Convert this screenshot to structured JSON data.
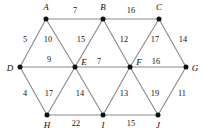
{
  "figure": {
    "type": "weighted-undirected-graph",
    "width": 202,
    "height": 133,
    "background_color": "#ffffff",
    "edge_color": "#8c8c8c",
    "node_color": "#111111",
    "text_color": "#111111"
  },
  "nodes": [
    {
      "id": "A",
      "label": "A",
      "x": 46,
      "y": 19,
      "label_x": 46,
      "label_y": 8,
      "row": "top"
    },
    {
      "id": "B",
      "label": "B",
      "x": 103,
      "y": 19,
      "label_x": 103,
      "label_y": 8,
      "row": "top"
    },
    {
      "id": "C",
      "label": "C",
      "x": 159,
      "y": 19,
      "label_x": 159,
      "label_y": 8,
      "row": "top"
    },
    {
      "id": "D",
      "label": "D",
      "x": 20,
      "y": 67,
      "label_x": 10,
      "label_y": 69,
      "row": "middle"
    },
    {
      "id": "E",
      "label": "E",
      "x": 75,
      "y": 67,
      "label_x": 84,
      "label_y": 63,
      "row": "middle"
    },
    {
      "id": "F",
      "label": "F",
      "x": 130,
      "y": 67,
      "label_x": 139,
      "label_y": 63,
      "row": "middle"
    },
    {
      "id": "G",
      "label": "G",
      "x": 186,
      "y": 67,
      "label_x": 195,
      "label_y": 69,
      "row": "middle"
    },
    {
      "id": "H",
      "label": "H",
      "x": 47,
      "y": 115,
      "label_x": 47,
      "label_y": 126,
      "row": "bottom"
    },
    {
      "id": "I",
      "label": "I",
      "x": 103,
      "y": 115,
      "label_x": 103,
      "label_y": 126,
      "row": "bottom"
    },
    {
      "id": "J",
      "label": "J",
      "x": 158,
      "y": 115,
      "label_x": 158,
      "label_y": 126,
      "row": "bottom"
    }
  ],
  "edges": [
    {
      "from": "A",
      "to": "B",
      "weight": 7,
      "label_x": 75,
      "label_y": 11
    },
    {
      "from": "B",
      "to": "C",
      "weight": 16,
      "label_x": 131,
      "label_y": 11
    },
    {
      "from": "D",
      "to": "A",
      "weight": 5,
      "label_x": 25,
      "label_y": 40
    },
    {
      "from": "A",
      "to": "E",
      "weight": 10,
      "label_x": 48,
      "label_y": 40
    },
    {
      "from": "E",
      "to": "B",
      "weight": 15,
      "label_x": 81,
      "label_y": 40
    },
    {
      "from": "B",
      "to": "F",
      "weight": 12,
      "label_x": 124,
      "label_y": 40
    },
    {
      "from": "F",
      "to": "C",
      "weight": 17,
      "label_x": 155,
      "label_y": 40
    },
    {
      "from": "C",
      "to": "G",
      "weight": 14,
      "label_x": 183,
      "label_y": 40
    },
    {
      "from": "D",
      "to": "E",
      "weight": 9,
      "label_x": 49,
      "label_y": 60
    },
    {
      "from": "E",
      "to": "F",
      "weight": 7,
      "label_x": 99,
      "label_y": 62
    },
    {
      "from": "F",
      "to": "G",
      "weight": 16,
      "label_x": 156,
      "label_y": 62
    },
    {
      "from": "D",
      "to": "H",
      "weight": 4,
      "label_x": 25,
      "label_y": 94
    },
    {
      "from": "H",
      "to": "E",
      "weight": 17,
      "label_x": 49,
      "label_y": 94
    },
    {
      "from": "E",
      "to": "I",
      "weight": 14,
      "label_x": 80,
      "label_y": 94
    },
    {
      "from": "I",
      "to": "F",
      "weight": 13,
      "label_x": 124,
      "label_y": 94
    },
    {
      "from": "F",
      "to": "J",
      "weight": 19,
      "label_x": 155,
      "label_y": 94
    },
    {
      "from": "J",
      "to": "G",
      "weight": 11,
      "label_x": 182,
      "label_y": 94
    },
    {
      "from": "H",
      "to": "I",
      "weight": 22,
      "label_x": 76,
      "label_y": 124
    },
    {
      "from": "I",
      "to": "J",
      "weight": 15,
      "label_x": 131,
      "label_y": 124
    }
  ]
}
